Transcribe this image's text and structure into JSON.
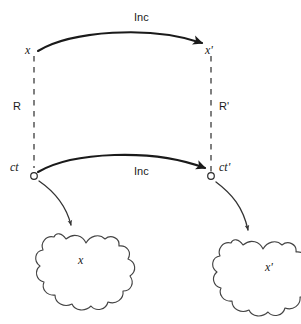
{
  "figure": {
    "kind": "commutative-diagram",
    "background_color": "#ffffff",
    "stroke_color": "#1a1a1a",
    "dash_color": "#555555",
    "blob_stroke_color": "#444444"
  },
  "nodes": {
    "x_upper_left": "x",
    "x_upper_right": "x'",
    "ct_lower_left": "ct",
    "ct_lower_right": "ct'"
  },
  "edges": {
    "inc_top": "Inc",
    "inc_bottom": "Inc",
    "relation_left": "R",
    "relation_right": "R'"
  },
  "blobs": {
    "left_label": "x",
    "right_label": "x'"
  }
}
